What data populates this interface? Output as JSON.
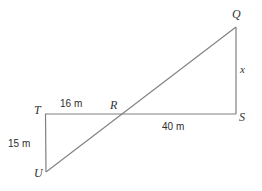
{
  "diagram": {
    "type": "geometry-figure",
    "stroke_color": "#808080",
    "background_color": "#ffffff",
    "vertices": [
      {
        "id": "T",
        "label": "T",
        "x": 45,
        "y": 114,
        "label_x": 34,
        "label_y": 104
      },
      {
        "id": "R",
        "label": "R",
        "x": 120,
        "y": 115,
        "label_x": 110,
        "label_y": 99
      },
      {
        "id": "S",
        "label": "S",
        "x": 236,
        "y": 114,
        "label_x": 239,
        "label_y": 111
      },
      {
        "id": "Q",
        "label": "Q",
        "x": 236,
        "y": 27,
        "label_x": 232,
        "label_y": 8
      },
      {
        "id": "U",
        "label": "U",
        "x": 46,
        "y": 172,
        "label_x": 34,
        "label_y": 167
      }
    ],
    "segments": [
      {
        "id": "TS",
        "from": "T",
        "to": "S"
      },
      {
        "id": "TU",
        "from": "T",
        "to": "U"
      },
      {
        "id": "QS",
        "from": "Q",
        "to": "S"
      },
      {
        "id": "UQ",
        "from": "U",
        "to": "Q"
      }
    ],
    "measurements": [
      {
        "id": "TR",
        "text": "16 m",
        "x": 60,
        "y": 99,
        "segment": "TR"
      },
      {
        "id": "RS",
        "text": "40 m",
        "x": 162,
        "y": 122,
        "segment": "RS"
      },
      {
        "id": "TU",
        "text": "15 m",
        "x": 8,
        "y": 139,
        "segment": "TU"
      },
      {
        "id": "QS",
        "text": "x",
        "x": 240,
        "y": 64,
        "segment": "QS"
      }
    ]
  }
}
